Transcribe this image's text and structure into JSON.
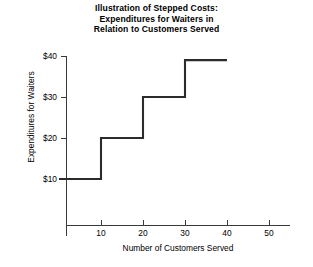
{
  "chart_data": {
    "type": "line",
    "subtype": "step",
    "title": "Illustration of Stepped Costs: Expenditures for Waiters in Relation to Customers Served",
    "title_lines": [
      "Illustration of Stepped Costs:",
      "Expenditures for Waiters in",
      "Relation to Customers Served"
    ],
    "xlabel": "Number of Customers Served",
    "ylabel": "Expenditures for Waiters",
    "xlim": [
      0,
      56
    ],
    "ylim": [
      0,
      44
    ],
    "xticks": [
      10,
      20,
      30,
      40,
      50
    ],
    "xtick_labels": [
      "10",
      "20",
      "30",
      "40",
      "50"
    ],
    "yticks": [
      10,
      20,
      30,
      40
    ],
    "ytick_labels": [
      "$10",
      "$20",
      "$30",
      "$40"
    ],
    "grid": false,
    "legend": false,
    "series": [
      {
        "name": "Expenditures for Waiters",
        "steps": [
          {
            "x_start": 0,
            "x_end": 10,
            "y": 10
          },
          {
            "x_start": 10,
            "x_end": 20,
            "y": 20
          },
          {
            "x_start": 20,
            "x_end": 30,
            "y": 30
          },
          {
            "x_start": 30,
            "x_end": 40,
            "y": 39
          }
        ],
        "points": [
          {
            "x": 0,
            "y": 10
          },
          {
            "x": 10,
            "y": 10
          },
          {
            "x": 10,
            "y": 20
          },
          {
            "x": 20,
            "y": 20
          },
          {
            "x": 20,
            "y": 30
          },
          {
            "x": 30,
            "y": 30
          },
          {
            "x": 30,
            "y": 39
          },
          {
            "x": 40,
            "y": 39
          }
        ],
        "color": "#2b2b2b"
      }
    ],
    "annotations": []
  },
  "axes": {
    "x_tick_labels": [
      "10",
      "20",
      "30",
      "40",
      "50"
    ],
    "y_tick_labels": [
      "$10",
      "$20",
      "$30",
      "$40"
    ],
    "x_title": "Number of Customers Served",
    "y_title": "Expenditures for Waiters"
  },
  "colors": {
    "line": "#2b2b2b",
    "axis": "#3a3a3a",
    "text": "#000000",
    "background": "#ffffff"
  }
}
